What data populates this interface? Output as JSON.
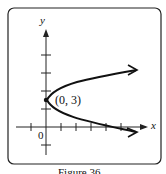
{
  "figure": {
    "axis_x_label": "x",
    "axis_y_label": "y",
    "origin_label": "0",
    "vertex_label": "(0, 3)",
    "caption": "Figure 36",
    "curve": "parabola opening right, vertex (0, 3)"
  }
}
